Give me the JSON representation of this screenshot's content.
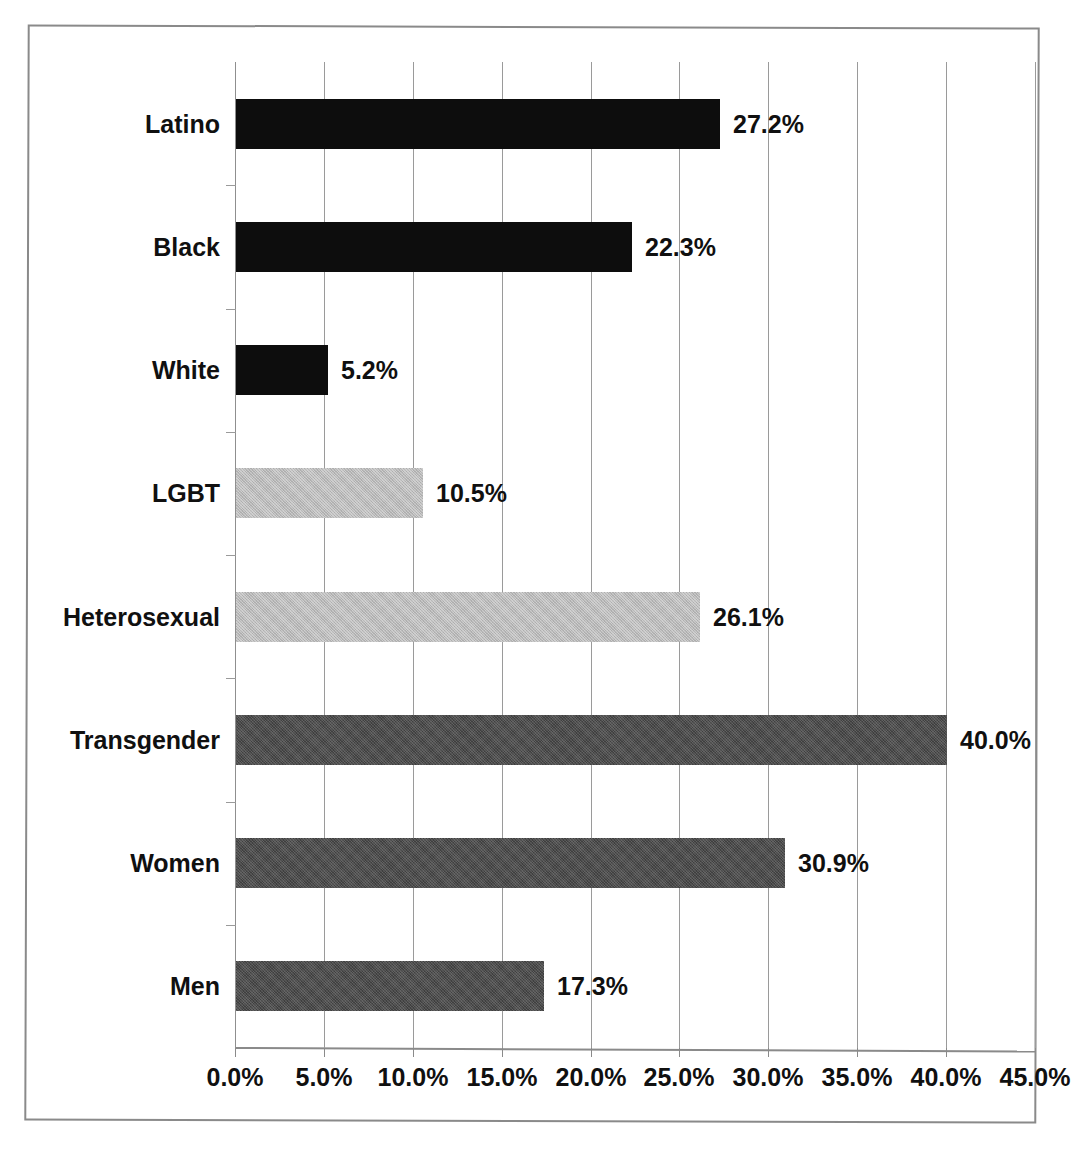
{
  "chart_data": {
    "type": "bar",
    "orientation": "horizontal",
    "title": "",
    "xlabel": "",
    "ylabel": "",
    "xlim": [
      0,
      45
    ],
    "grid": true,
    "legend": false,
    "categories": [
      "Latino",
      "Black",
      "White",
      "LGBT",
      "Heterosexual",
      "Transgender",
      "Women",
      "Men"
    ],
    "values": [
      27.2,
      22.3,
      5.2,
      10.5,
      26.1,
      40.0,
      30.9,
      17.3
    ],
    "data_labels": [
      "27.2%",
      "22.3%",
      "5.2%",
      "10.5%",
      "26.1%",
      "40.0%",
      "30.9%",
      "17.3%"
    ],
    "bar_colors": [
      "#0d0d0d",
      "#0d0d0d",
      "#0d0d0d",
      "#b9b9b9",
      "#b9b9b9",
      "#4d4d4d",
      "#4d4d4d",
      "#4d4d4d"
    ],
    "bar_color_names": [
      "black",
      "black",
      "black",
      "lightgray",
      "lightgray",
      "darkgray",
      "darkgray",
      "darkgray"
    ],
    "xticks": [
      0,
      5,
      10,
      15,
      20,
      25,
      30,
      35,
      40,
      45
    ],
    "xtick_labels": [
      "0.0%",
      "5.0%",
      "10.0%",
      "15.0%",
      "20.0%",
      "25.0%",
      "30.0%",
      "35.0%",
      "40.0%",
      "45.0%"
    ]
  },
  "figure": {
    "frame_color": "#8a8a8a",
    "gridline_color": "#9a9a9a",
    "axis_color": "#8a8a8a",
    "text_color": "#101010",
    "background": "#ffffff"
  },
  "caption": {
    "text": ""
  }
}
